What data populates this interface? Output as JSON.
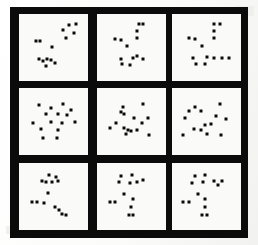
{
  "figure": {
    "type": "scatter-panel-grid",
    "title": "",
    "rows": 3,
    "columns": 3,
    "panel_count": 9,
    "marker_shape": "square",
    "marker_size_px": 3,
    "colors": {
      "frame": "#0b0b0b",
      "panel_background": "#fafaf8",
      "marker": "#0a0a0a",
      "page_background": "#fdfdfc"
    },
    "geometry": {
      "frame_x": 10,
      "frame_y": 7,
      "frame_width": 238,
      "frame_height": 231,
      "frame_thickness": 9,
      "gutter_thickness": 9,
      "panel_width": 69,
      "panel_height": 67,
      "column_x": [
        19,
        97,
        172
      ],
      "row_y": [
        14,
        88,
        163
      ]
    }
  },
  "chart_data": {
    "type": "scatter",
    "title": "",
    "xlabel": "",
    "ylabel": "",
    "xlim": [
      0,
      100
    ],
    "ylim": [
      0,
      100
    ],
    "grid": false,
    "legend": null,
    "axis_ticks": false,
    "axis_labels": false,
    "marker": "square",
    "marker_color": "#0a0a0a",
    "panels": [
      {
        "id": "panel-r1c1",
        "row": 1,
        "column": 1,
        "n_points": 14,
        "points": [
          [
            77,
            89
          ],
          [
            88,
            92
          ],
          [
            84,
            76
          ],
          [
            66,
            80
          ],
          [
            72,
            66
          ],
          [
            20,
            62
          ],
          [
            27,
            61
          ],
          [
            48,
            51
          ],
          [
            25,
            30
          ],
          [
            32,
            27
          ],
          [
            39,
            30
          ],
          [
            45,
            28
          ],
          [
            38,
            18
          ],
          [
            52,
            22
          ]
        ]
      },
      {
        "id": "panel-r1c2",
        "row": 1,
        "column": 2,
        "n_points": 13,
        "points": [
          [
            62,
            91
          ],
          [
            70,
            91
          ],
          [
            60,
            79
          ],
          [
            60,
            66
          ],
          [
            22,
            65
          ],
          [
            32,
            64
          ],
          [
            43,
            53
          ],
          [
            33,
            30
          ],
          [
            52,
            32
          ],
          [
            60,
            35
          ],
          [
            70,
            30
          ],
          [
            34,
            21
          ],
          [
            48,
            20
          ]
        ]
      },
      {
        "id": "panel-r1c3",
        "row": 1,
        "column": 3,
        "n_points": 14,
        "points": [
          [
            63,
            91
          ],
          [
            73,
            92
          ],
          [
            63,
            79
          ],
          [
            63,
            67
          ],
          [
            20,
            66
          ],
          [
            30,
            65
          ],
          [
            42,
            53
          ],
          [
            27,
            31
          ],
          [
            50,
            33
          ],
          [
            62,
            32
          ],
          [
            76,
            32
          ],
          [
            33,
            21
          ],
          [
            47,
            21
          ],
          [
            88,
            32
          ]
        ]
      },
      {
        "id": "panel-r2c1",
        "row": 2,
        "column": 1,
        "n_points": 15,
        "points": [
          [
            26,
            79
          ],
          [
            46,
            74
          ],
          [
            66,
            80
          ],
          [
            79,
            70
          ],
          [
            38,
            64
          ],
          [
            57,
            63
          ],
          [
            73,
            62
          ],
          [
            16,
            48
          ],
          [
            46,
            50
          ],
          [
            64,
            48
          ],
          [
            86,
            50
          ],
          [
            28,
            36
          ],
          [
            58,
            35
          ],
          [
            32,
            21
          ],
          [
            56,
            21
          ]
        ]
      },
      {
        "id": "panel-r2c2",
        "row": 2,
        "column": 2,
        "n_points": 15,
        "points": [
          [
            36,
            76
          ],
          [
            69,
            80
          ],
          [
            32,
            66
          ],
          [
            38,
            63
          ],
          [
            55,
            57
          ],
          [
            78,
            57
          ],
          [
            24,
            47
          ],
          [
            68,
            48
          ],
          [
            14,
            38
          ],
          [
            38,
            38
          ],
          [
            44,
            35
          ],
          [
            49,
            33
          ],
          [
            41,
            28
          ],
          [
            80,
            26
          ],
          [
            60,
            35
          ]
        ]
      },
      {
        "id": "panel-r2c3",
        "row": 2,
        "column": 3,
        "n_points": 14,
        "points": [
          [
            30,
            76
          ],
          [
            73,
            80
          ],
          [
            20,
            68
          ],
          [
            40,
            68
          ],
          [
            14,
            57
          ],
          [
            66,
            59
          ],
          [
            83,
            55
          ],
          [
            47,
            44
          ],
          [
            58,
            45
          ],
          [
            28,
            36
          ],
          [
            40,
            35
          ],
          [
            10,
            27
          ],
          [
            50,
            28
          ],
          [
            75,
            26
          ]
        ]
      },
      {
        "id": "panel-r3c1",
        "row": 3,
        "column": 1,
        "n_points": 14,
        "points": [
          [
            43,
            88
          ],
          [
            55,
            84
          ],
          [
            30,
            78
          ],
          [
            37,
            76
          ],
          [
            48,
            76
          ],
          [
            57,
            77
          ],
          [
            41,
            56
          ],
          [
            13,
            41
          ],
          [
            22,
            41
          ],
          [
            34,
            38
          ],
          [
            52,
            32
          ],
          [
            60,
            26
          ],
          [
            65,
            20
          ],
          [
            72,
            18
          ]
        ]
      },
      {
        "id": "panel-r3c2",
        "row": 3,
        "column": 2,
        "n_points": 13,
        "points": [
          [
            32,
            86
          ],
          [
            50,
            88
          ],
          [
            28,
            75
          ],
          [
            47,
            74
          ],
          [
            60,
            75
          ],
          [
            70,
            79
          ],
          [
            37,
            55
          ],
          [
            13,
            41
          ],
          [
            22,
            41
          ],
          [
            53,
            45
          ],
          [
            49,
            31
          ],
          [
            45,
            18
          ],
          [
            53,
            18
          ]
        ]
      },
      {
        "id": "panel-r3c3",
        "row": 3,
        "column": 3,
        "n_points": 14,
        "points": [
          [
            30,
            86
          ],
          [
            48,
            88
          ],
          [
            25,
            74
          ],
          [
            44,
            75
          ],
          [
            62,
            77
          ],
          [
            76,
            78
          ],
          [
            70,
            70
          ],
          [
            36,
            55
          ],
          [
            11,
            41
          ],
          [
            21,
            41
          ],
          [
            48,
            45
          ],
          [
            47,
            31
          ],
          [
            43,
            18
          ],
          [
            51,
            18
          ]
        ]
      }
    ]
  }
}
